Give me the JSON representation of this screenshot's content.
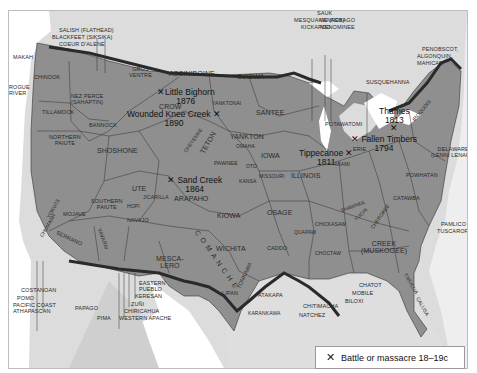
{
  "map": {
    "title": "Native American tribal territories and battles",
    "colors": {
      "territory": "#8f8f8f",
      "land_outside": "#d9d9d9",
      "water": "#ffffff",
      "border_line": "#2a2a2a",
      "boundary": "#333333"
    }
  },
  "tribes": {
    "makah": "MAKAH",
    "salish": "SALISH (FLATHEAD)",
    "blackfeet": "BLACKFEET (SIKSIKA)",
    "coeur": "COEUR D'ALENE",
    "chinook": "CHINOOK",
    "gros_ventre": "GROS\nVENTRE",
    "assiniboine": "ASSINIBOINE",
    "ojibwa": "OJIBWA",
    "nez_perce": "NEZ PERCE\n(SAHAPTIN)",
    "rogue_river": "ROGUE\nRIVER",
    "tillamook": "TILLAMOOK",
    "bannock": "BANNOCK",
    "crow": "CROW",
    "yanktonai": "YANKTONAI",
    "santee": "SANTEE",
    "cheyenne": "CHEYENNE",
    "teton": "TETON",
    "yankton": "YANKTON",
    "omaha": "OMAHA",
    "northern_paiute": "NORTHERN\nPAIUTE",
    "shoshone": "SHOSHONE",
    "iowa": "IOWA",
    "pawnee": "PAWNEE",
    "oto": "OTO",
    "kansa": "KANSA",
    "missouri": "MISSOURI",
    "illinois": "ILLINOIS",
    "ute": "UTE",
    "jicarilla": "JICARILLA",
    "arapaho": "ARAPAHO",
    "yokuts": "YOKUTS",
    "mojave": "MOJAVE",
    "southern_paiute": "SOUTHERN\nPAIUTE",
    "hopi": "HOPI",
    "navajo": "NAVAJO",
    "chumash": "CHUMASH",
    "serrano": "SERRANO",
    "yavapai": "YAVAPAI",
    "kiowa": "KIOWA",
    "osage": "OSAGE",
    "comanche": "COMANCHE",
    "mescalero": "MESCA-\nLERO",
    "wichita": "WICHITA",
    "caddo": "CADDO",
    "quapaw": "QUAPAW",
    "chickasaw": "CHICKASAW",
    "choctaw": "CHOCTAW",
    "tonkawa": "TONKAWA",
    "lipan": "LIPAN",
    "atakapa": "ATAKAPA",
    "karankawa": "KARANKAWA",
    "costanoan": "COSTANOAN",
    "pomo": "POMO",
    "pacific_coast": "PACIFIC COAST\nATHAPASCAN",
    "papago": "PAPAGO",
    "pima": "PIMA",
    "eastern_pueblo": "EASTERN\nPUEBLO",
    "keresan": "KERESAN",
    "zuni": "ZUÑI",
    "chiricahua": "CHIRICAHUA",
    "western_apache": "WESTERN APACHE",
    "mesquakie": "MESQUAKIE (FOX)",
    "kickapoo": "KICKAPOO",
    "sauk": "SAUK",
    "winnebago": "WINNEBAGO",
    "menominee": "MENOMINEE",
    "susquehanna": "SUSQUEHANNA",
    "penobscot": "PENOBSCOT,",
    "algonquin": "ALGONQUIN,",
    "mahican": "MAHICAN",
    "iroquois": "IROQUOIS",
    "potawatomi": "POTAWATOMI",
    "erie": "ERIE",
    "miami": "MIAMI",
    "delaware": "DELAWARE\n(LENNI LENAPE)",
    "powhatan": "POWHATAN",
    "shawnee": "SHAWNEE",
    "yuchi": "YUCHI",
    "cherokee": "CHEROKEE",
    "catawba": "CATAWBA",
    "pamlico": "PAMLICO",
    "tuscarora": "TUSCARORA",
    "creek": "CREEK\n(MUSKOGEE)",
    "timucua": "TIMUCUA",
    "calusa": "CALUSA",
    "chatot": "CHATOT",
    "mobile": "MOBILE",
    "biloxi": "BILOXI",
    "chitimacha": "CHITIMACHA",
    "natchez": "NATCHEZ"
  },
  "battles": [
    {
      "name": "Little Bighorn",
      "year": "1876"
    },
    {
      "name": "Wounded Knee Creek",
      "year": "1890"
    },
    {
      "name": "Sand Creek",
      "year": "1864"
    },
    {
      "name": "Tippecanoe",
      "year": "1811"
    },
    {
      "name": "Thames",
      "year": "1813"
    },
    {
      "name": "Fallen Timbers",
      "year": "1794"
    }
  ],
  "legend": {
    "symbol": "✕",
    "label": "Battle or massacre 18–19c"
  }
}
